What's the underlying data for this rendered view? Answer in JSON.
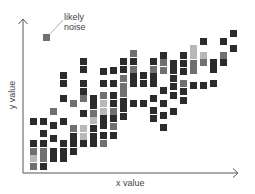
{
  "chart_data": {
    "type": "heatmap",
    "title": "",
    "xlabel": "x value",
    "ylabel": "y value",
    "annotation": {
      "text_line1": "likely",
      "text_line2": "noise",
      "target": [
        44,
        36
      ]
    },
    "grid": false,
    "legend": null,
    "colors": {
      "dark": "#2b2b2b",
      "mid": "#707070",
      "light": "#b8b8b8",
      "axis": "#555555"
    },
    "cells": [
      {
        "x": 30,
        "y": 118,
        "c": "dark"
      },
      {
        "x": 30,
        "y": 140,
        "c": "dark"
      },
      {
        "x": 30,
        "y": 148,
        "c": "mid"
      },
      {
        "x": 30,
        "y": 155,
        "c": "light"
      },
      {
        "x": 30,
        "y": 163,
        "c": "mid"
      },
      {
        "x": 40,
        "y": 118,
        "c": "dark"
      },
      {
        "x": 40,
        "y": 130,
        "c": "dark"
      },
      {
        "x": 40,
        "y": 140,
        "c": "dark"
      },
      {
        "x": 40,
        "y": 148,
        "c": "mid"
      },
      {
        "x": 40,
        "y": 155,
        "c": "mid"
      },
      {
        "x": 40,
        "y": 163,
        "c": "dark"
      },
      {
        "x": 50,
        "y": 108,
        "c": "mid"
      },
      {
        "x": 50,
        "y": 122,
        "c": "dark"
      },
      {
        "x": 50,
        "y": 135,
        "c": "dark"
      },
      {
        "x": 50,
        "y": 148,
        "c": "dark"
      },
      {
        "x": 50,
        "y": 155,
        "c": "dark"
      },
      {
        "x": 60,
        "y": 72,
        "c": "dark"
      },
      {
        "x": 60,
        "y": 80,
        "c": "dark"
      },
      {
        "x": 60,
        "y": 95,
        "c": "dark"
      },
      {
        "x": 60,
        "y": 118,
        "c": "dark"
      },
      {
        "x": 60,
        "y": 140,
        "c": "dark"
      },
      {
        "x": 60,
        "y": 148,
        "c": "dark"
      },
      {
        "x": 60,
        "y": 155,
        "c": "dark"
      },
      {
        "x": 70,
        "y": 100,
        "c": "mid"
      },
      {
        "x": 70,
        "y": 125,
        "c": "mid"
      },
      {
        "x": 70,
        "y": 133,
        "c": "dark"
      },
      {
        "x": 70,
        "y": 140,
        "c": "dark"
      },
      {
        "x": 70,
        "y": 148,
        "c": "dark"
      },
      {
        "x": 80,
        "y": 58,
        "c": "dark"
      },
      {
        "x": 80,
        "y": 66,
        "c": "dark"
      },
      {
        "x": 80,
        "y": 80,
        "c": "dark"
      },
      {
        "x": 80,
        "y": 88,
        "c": "dark"
      },
      {
        "x": 80,
        "y": 95,
        "c": "mid"
      },
      {
        "x": 80,
        "y": 110,
        "c": "dark"
      },
      {
        "x": 80,
        "y": 125,
        "c": "light"
      },
      {
        "x": 80,
        "y": 133,
        "c": "light"
      },
      {
        "x": 80,
        "y": 140,
        "c": "dark"
      },
      {
        "x": 90,
        "y": 95,
        "c": "dark"
      },
      {
        "x": 90,
        "y": 102,
        "c": "dark"
      },
      {
        "x": 90,
        "y": 110,
        "c": "mid"
      },
      {
        "x": 90,
        "y": 117,
        "c": "light"
      },
      {
        "x": 90,
        "y": 125,
        "c": "dark"
      },
      {
        "x": 90,
        "y": 133,
        "c": "dark"
      },
      {
        "x": 90,
        "y": 140,
        "c": "dark"
      },
      {
        "x": 100,
        "y": 68,
        "c": "dark"
      },
      {
        "x": 100,
        "y": 80,
        "c": "dark"
      },
      {
        "x": 100,
        "y": 92,
        "c": "mid"
      },
      {
        "x": 100,
        "y": 100,
        "c": "light"
      },
      {
        "x": 100,
        "y": 108,
        "c": "light"
      },
      {
        "x": 100,
        "y": 115,
        "c": "dark"
      },
      {
        "x": 100,
        "y": 122,
        "c": "dark"
      },
      {
        "x": 100,
        "y": 132,
        "c": "dark"
      },
      {
        "x": 100,
        "y": 140,
        "c": "mid"
      },
      {
        "x": 110,
        "y": 67,
        "c": "dark"
      },
      {
        "x": 110,
        "y": 80,
        "c": "dark"
      },
      {
        "x": 110,
        "y": 92,
        "c": "dark"
      },
      {
        "x": 110,
        "y": 100,
        "c": "dark"
      },
      {
        "x": 110,
        "y": 108,
        "c": "mid"
      },
      {
        "x": 110,
        "y": 115,
        "c": "dark"
      },
      {
        "x": 110,
        "y": 123,
        "c": "mid"
      },
      {
        "x": 110,
        "y": 132,
        "c": "dark"
      },
      {
        "x": 120,
        "y": 58,
        "c": "dark"
      },
      {
        "x": 120,
        "y": 66,
        "c": "dark"
      },
      {
        "x": 120,
        "y": 75,
        "c": "mid"
      },
      {
        "x": 120,
        "y": 83,
        "c": "mid"
      },
      {
        "x": 120,
        "y": 90,
        "c": "mid"
      },
      {
        "x": 120,
        "y": 98,
        "c": "dark"
      },
      {
        "x": 120,
        "y": 105,
        "c": "dark"
      },
      {
        "x": 120,
        "y": 113,
        "c": "dark"
      },
      {
        "x": 130,
        "y": 50,
        "c": "mid"
      },
      {
        "x": 130,
        "y": 58,
        "c": "dark"
      },
      {
        "x": 130,
        "y": 66,
        "c": "mid"
      },
      {
        "x": 130,
        "y": 73,
        "c": "dark"
      },
      {
        "x": 130,
        "y": 80,
        "c": "dark"
      },
      {
        "x": 130,
        "y": 100,
        "c": "dark"
      },
      {
        "x": 140,
        "y": 72,
        "c": "dark"
      },
      {
        "x": 140,
        "y": 80,
        "c": "dark"
      },
      {
        "x": 140,
        "y": 100,
        "c": "dark"
      },
      {
        "x": 150,
        "y": 58,
        "c": "dark"
      },
      {
        "x": 150,
        "y": 66,
        "c": "mid"
      },
      {
        "x": 150,
        "y": 73,
        "c": "dark"
      },
      {
        "x": 150,
        "y": 80,
        "c": "dark"
      },
      {
        "x": 150,
        "y": 95,
        "c": "dark"
      },
      {
        "x": 150,
        "y": 107,
        "c": "dark"
      },
      {
        "x": 150,
        "y": 115,
        "c": "dark"
      },
      {
        "x": 160,
        "y": 52,
        "c": "dark"
      },
      {
        "x": 160,
        "y": 59,
        "c": "mid"
      },
      {
        "x": 160,
        "y": 67,
        "c": "mid"
      },
      {
        "x": 160,
        "y": 87,
        "c": "dark"
      },
      {
        "x": 160,
        "y": 100,
        "c": "dark"
      },
      {
        "x": 160,
        "y": 112,
        "c": "dark"
      },
      {
        "x": 160,
        "y": 124,
        "c": "dark"
      },
      {
        "x": 170,
        "y": 60,
        "c": "dark"
      },
      {
        "x": 170,
        "y": 67,
        "c": "dark"
      },
      {
        "x": 170,
        "y": 75,
        "c": "dark"
      },
      {
        "x": 170,
        "y": 83,
        "c": "dark"
      },
      {
        "x": 170,
        "y": 92,
        "c": "dark"
      },
      {
        "x": 170,
        "y": 108,
        "c": "dark"
      },
      {
        "x": 180,
        "y": 52,
        "c": "dark"
      },
      {
        "x": 180,
        "y": 60,
        "c": "dark"
      },
      {
        "x": 180,
        "y": 68,
        "c": "dark"
      },
      {
        "x": 180,
        "y": 80,
        "c": "mid"
      },
      {
        "x": 180,
        "y": 88,
        "c": "dark"
      },
      {
        "x": 180,
        "y": 97,
        "c": "dark"
      },
      {
        "x": 190,
        "y": 45,
        "c": "light"
      },
      {
        "x": 190,
        "y": 52,
        "c": "light"
      },
      {
        "x": 190,
        "y": 60,
        "c": "mid"
      },
      {
        "x": 190,
        "y": 67,
        "c": "mid"
      },
      {
        "x": 190,
        "y": 82,
        "c": "dark"
      },
      {
        "x": 200,
        "y": 38,
        "c": "dark"
      },
      {
        "x": 200,
        "y": 52,
        "c": "light"
      },
      {
        "x": 200,
        "y": 59,
        "c": "mid"
      },
      {
        "x": 200,
        "y": 82,
        "c": "dark"
      },
      {
        "x": 210,
        "y": 59,
        "c": "dark"
      },
      {
        "x": 210,
        "y": 66,
        "c": "dark"
      },
      {
        "x": 210,
        "y": 80,
        "c": "dark"
      },
      {
        "x": 220,
        "y": 38,
        "c": "dark"
      },
      {
        "x": 220,
        "y": 52,
        "c": "mid"
      },
      {
        "x": 220,
        "y": 59,
        "c": "dark"
      },
      {
        "x": 230,
        "y": 30,
        "c": "dark"
      },
      {
        "x": 230,
        "y": 45,
        "c": "dark"
      }
    ],
    "noise_cell": {
      "x": 43,
      "y": 34,
      "c": "mid"
    }
  }
}
